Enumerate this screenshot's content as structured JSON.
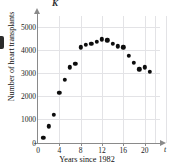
{
  "figure": {
    "corner_label": "K",
    "x_axis_letter": "t"
  },
  "chart_data": {
    "type": "scatter",
    "title": "",
    "xlabel": "Years since 1982",
    "ylabel": "Number of heart transplants",
    "xlim": [
      0,
      24
    ],
    "ylim": [
      0,
      5600
    ],
    "grid": true,
    "legend": "none",
    "xticks": [
      "0",
      "4",
      "8",
      "12",
      "16",
      "20"
    ],
    "xtick_values": [
      0,
      4,
      8,
      12,
      16,
      20
    ],
    "yticks": [
      "0",
      "1000",
      "2000",
      "3000",
      "4000",
      "5000"
    ],
    "ytick_values": [
      0,
      1000,
      2000,
      3000,
      4000,
      5000
    ],
    "x": [
      1,
      2,
      3,
      4,
      5,
      6,
      7,
      8,
      9,
      10,
      11,
      12,
      13,
      14,
      15,
      16,
      17,
      18,
      19,
      20,
      21
    ],
    "values": [
      200,
      700,
      1200,
      2150,
      2700,
      3250,
      3400,
      4100,
      4200,
      4250,
      4350,
      4450,
      4400,
      4250,
      4150,
      4100,
      3750,
      3450,
      3150,
      3250,
      3050
    ],
    "series": [
      {
        "name": "Number of heart transplants",
        "values": [
          200,
          700,
          1200,
          2150,
          2700,
          3250,
          3400,
          4100,
          4200,
          4250,
          4350,
          4450,
          4400,
          4250,
          4150,
          4100,
          3750,
          3450,
          3150,
          3250,
          3050
        ]
      }
    ]
  }
}
